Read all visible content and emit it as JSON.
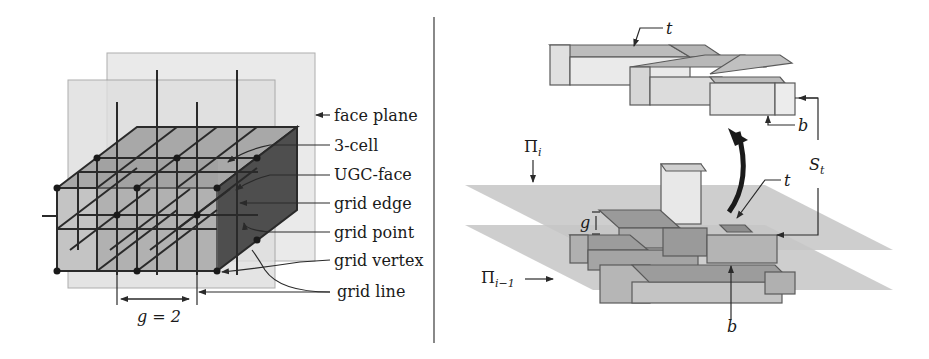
{
  "left_panel": {
    "labels": {
      "face_plane": "face plane",
      "three_cell": "3-cell",
      "ugc_face": "UGC-face",
      "grid_edge": "grid edge",
      "grid_point": "grid point",
      "grid_vertex": "grid vertex",
      "grid_line": "grid line"
    },
    "spacing_label": "g = 2"
  },
  "right_panel": {
    "labels": {
      "t_top": "t",
      "b_top": "b",
      "S": "S",
      "S_sub": "t",
      "t_bottom": "t",
      "b_bottom": "b",
      "g": "g",
      "Pi": "Π",
      "Pi_i_sub": "i",
      "Pi_im1_sub": "i−1"
    }
  },
  "colors": {
    "line": "#2a2a2a",
    "plane": "#c8c8c8",
    "box_fill": "#bdbdbd",
    "dark_face": "#5a5a5a"
  }
}
